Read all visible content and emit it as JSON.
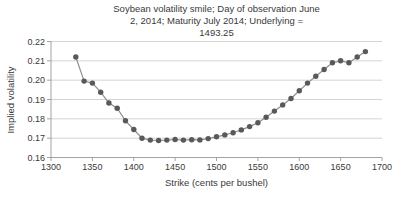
{
  "chart_data": {
    "type": "line",
    "title": "Soybean volatility smile; Day of observation June 2, 2014; Maturity July 2014; Underlying = 1493.25",
    "title_lines": [
      "Soybean volatility smile; Day of observation June",
      "2, 2014; Maturity July 2014; Underlying =",
      "1493.25"
    ],
    "xlabel": "Strike (cents per bushel)",
    "ylabel": "Implied volatility",
    "xlim": [
      1300,
      1700
    ],
    "ylim": [
      0.16,
      0.22
    ],
    "xticks": [
      1300,
      1350,
      1400,
      1450,
      1500,
      1550,
      1600,
      1650,
      1700
    ],
    "yticks": [
      0.16,
      0.17,
      0.18,
      0.19,
      0.2,
      0.21,
      0.22
    ],
    "grid": true,
    "legend": "none",
    "x": [
      1330,
      1340,
      1350,
      1360,
      1370,
      1380,
      1390,
      1400,
      1410,
      1420,
      1430,
      1440,
      1450,
      1460,
      1470,
      1480,
      1490,
      1500,
      1510,
      1520,
      1530,
      1540,
      1550,
      1560,
      1570,
      1580,
      1590,
      1600,
      1610,
      1620,
      1630,
      1640,
      1650,
      1660,
      1670,
      1680
    ],
    "y": [
      0.212,
      0.1995,
      0.1985,
      0.1938,
      0.1882,
      0.1855,
      0.179,
      0.1745,
      0.17,
      0.169,
      0.1688,
      0.169,
      0.1693,
      0.169,
      0.1692,
      0.1691,
      0.1698,
      0.1707,
      0.1717,
      0.1728,
      0.1743,
      0.176,
      0.178,
      0.1808,
      0.184,
      0.1872,
      0.1905,
      0.1945,
      0.1985,
      0.202,
      0.2055,
      0.209,
      0.21,
      0.209,
      0.212,
      0.2148
    ],
    "marker_color": "#595959",
    "line_color": "#8f8f8f",
    "grid_color": "#d4d4d4",
    "axis_color": "#a3a3a3",
    "text_color": "#3a3a3a"
  }
}
